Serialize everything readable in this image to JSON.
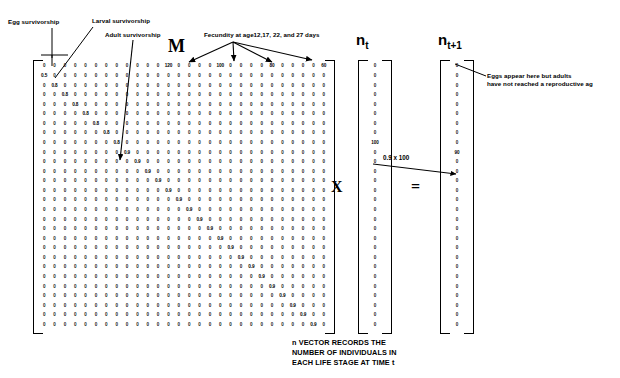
{
  "annotations": {
    "egg_survivorship": "Egg survivorship",
    "larval_survivorship": "Larval survivorship",
    "adult_survivorship": "Adult survivorship",
    "fecundity": "Fecundity at age12,17, 22, and 27 days",
    "eggs_note_line1": "Eggs appear here but adults",
    "eggs_note_line2": "have not reached a reproductive ag",
    "product_label": "0.9 x 100"
  },
  "symbols": {
    "matrix_label": "M",
    "multiply": "X",
    "equals": "=",
    "nt_label": "n",
    "nt_sub": "t",
    "nt1_label": "n",
    "nt1_sub": "t+1"
  },
  "caption": {
    "line1": "n VECTOR RECORDS THE",
    "line2": "NUMBER OF INDIVIDUALS IN",
    "line3": "EACH LIFE STAGE AT TIME t"
  },
  "matrix": {
    "rows": 28,
    "cols": 28,
    "zero": "0",
    "egg_survivorship_value": "0.5",
    "larval_survivorship_value": "0.8",
    "adult_survivorship_value": "0.9",
    "larval_rows": [
      2,
      3,
      4,
      5,
      6,
      7,
      8
    ],
    "fecundity_columns": [
      12,
      17,
      22,
      27
    ],
    "fecundity_values": [
      "120",
      "100",
      "80",
      "60"
    ]
  },
  "vectors": {
    "nt": {
      "size": 28,
      "zero": "0",
      "nonzero_index": 8,
      "nonzero_value": "100"
    },
    "nt1": {
      "size": 28,
      "zero": "0",
      "nonzero_index": 9,
      "nonzero_value": "90"
    }
  },
  "colors": {
    "ink": "#000000",
    "background": "#ffffff"
  }
}
